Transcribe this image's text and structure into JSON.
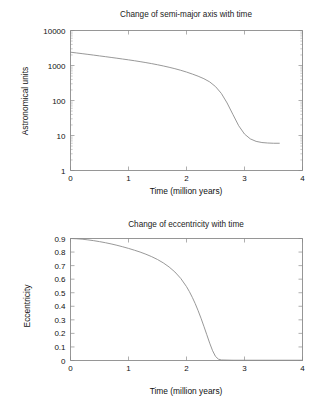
{
  "page": {
    "background_color": "#ffffff",
    "axis_color": "#8a8a8a",
    "curve_color": "#8c8c8c",
    "text_color": "#111111"
  },
  "chart_data": [
    {
      "type": "line",
      "id": "semi-major-axis",
      "title": "Change of semi-major axis with time",
      "xlabel": "Time (million years)",
      "ylabel": "Astronomical units",
      "xlim": [
        0,
        4
      ],
      "ylim": [
        1,
        10000
      ],
      "yscale": "log",
      "xscale": "linear",
      "grid": false,
      "legend": false,
      "xticks": [
        0,
        1,
        2,
        3,
        4
      ],
      "xticklabels": [
        "0",
        "1",
        "2",
        "3",
        "4"
      ],
      "yticks": [
        1,
        10,
        100,
        1000,
        10000
      ],
      "yticklabels": [
        "1",
        "10",
        "100",
        "1000",
        "10000"
      ],
      "series": [
        {
          "name": "semi-major axis",
          "x": [
            0.0,
            0.1,
            0.2,
            0.3,
            0.4,
            0.5,
            0.6,
            0.7,
            0.8,
            0.9,
            1.0,
            1.1,
            1.2,
            1.3,
            1.4,
            1.5,
            1.6,
            1.7,
            1.8,
            1.9,
            2.0,
            2.1,
            2.2,
            2.3,
            2.4,
            2.5,
            2.6,
            2.7,
            2.8,
            2.9,
            3.0,
            3.1,
            3.2,
            3.3,
            3.4,
            3.5,
            3.6
          ],
          "y": [
            2400,
            2290,
            2180,
            2080,
            1980,
            1880,
            1790,
            1700,
            1615,
            1530,
            1450,
            1370,
            1290,
            1210,
            1130,
            1050,
            970,
            890,
            810,
            730,
            650,
            570,
            495,
            420,
            340,
            250,
            160,
            85,
            40,
            19,
            11,
            8.0,
            6.8,
            6.3,
            6.1,
            6.0,
            6.0
          ],
          "units": "AU"
        }
      ],
      "annotations": {
        "start_value": 2400,
        "end_value": 6,
        "end_time": 3.6,
        "collapse_start_time": 2.3,
        "collapse_end_time": 3.1
      }
    },
    {
      "type": "line",
      "id": "eccentricity",
      "title": "Change of eccentricity with time",
      "xlabel": "Time (million years)",
      "ylabel": "Eccentricity",
      "xlim": [
        0,
        4
      ],
      "ylim": [
        0,
        0.9
      ],
      "yscale": "linear",
      "xscale": "linear",
      "grid": false,
      "legend": false,
      "xticks": [
        0,
        1,
        2,
        3,
        4
      ],
      "xticklabels": [
        "0",
        "1",
        "2",
        "3",
        "4"
      ],
      "yticks": [
        0,
        0.1,
        0.2,
        0.3,
        0.4,
        0.5,
        0.6,
        0.7,
        0.8,
        0.9
      ],
      "yticklabels": [
        "0",
        "0.1",
        "0.2",
        "0.3",
        "0.4",
        "0.5",
        "0.6",
        "0.7",
        "0.8",
        "0.9"
      ],
      "series": [
        {
          "name": "eccentricity",
          "x": [
            0.0,
            0.1,
            0.2,
            0.3,
            0.4,
            0.5,
            0.6,
            0.7,
            0.8,
            0.9,
            1.0,
            1.1,
            1.2,
            1.3,
            1.4,
            1.5,
            1.6,
            1.7,
            1.8,
            1.9,
            2.0,
            2.05,
            2.1,
            2.15,
            2.2,
            2.25,
            2.3,
            2.35,
            2.4,
            2.45,
            2.5,
            2.55,
            2.6,
            2.8,
            3.0,
            3.5,
            4.0
          ],
          "y": [
            0.9,
            0.898,
            0.895,
            0.89,
            0.884,
            0.877,
            0.869,
            0.86,
            0.85,
            0.839,
            0.827,
            0.814,
            0.8,
            0.784,
            0.766,
            0.745,
            0.72,
            0.69,
            0.653,
            0.606,
            0.545,
            0.508,
            0.466,
            0.42,
            0.368,
            0.312,
            0.252,
            0.19,
            0.128,
            0.072,
            0.03,
            0.01,
            0.004,
            0.002,
            0.002,
            0.002,
            0.002
          ],
          "units": ""
        }
      ],
      "annotations": {
        "start_value": 0.9,
        "circularization_time": 2.45,
        "end_value": 0.0
      }
    }
  ]
}
